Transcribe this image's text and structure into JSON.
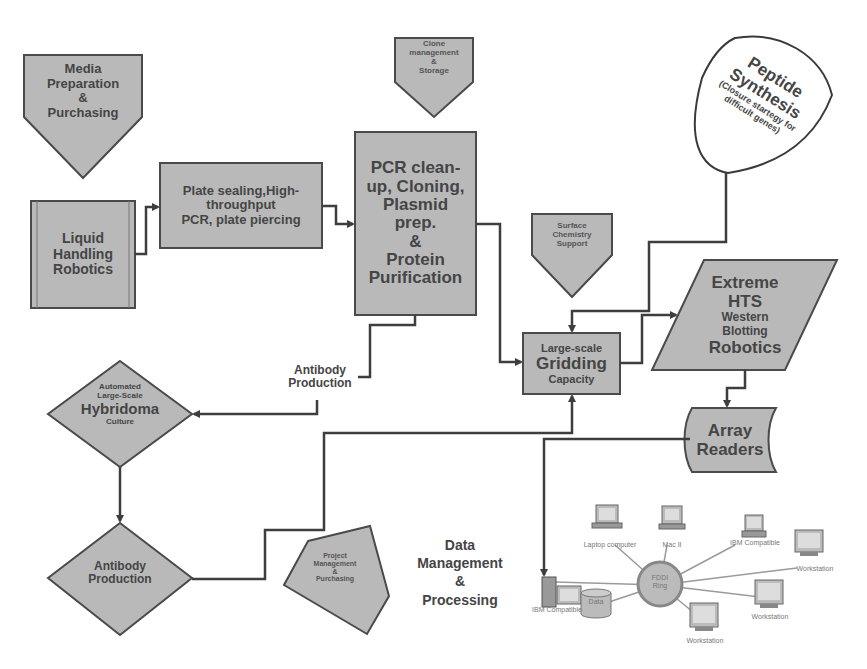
{
  "diagram": {
    "nodes": {
      "media_prep": {
        "lines": [
          "Media",
          "Preparation",
          "&",
          "Purchasing"
        ],
        "shape": "pentagon-down"
      },
      "liquid_handling": {
        "lines": [
          "Liquid",
          "Handling",
          "Robotics"
        ],
        "shape": "rectangle"
      },
      "plate_sealing": {
        "lines": [
          "Plate sealing,High-",
          "throughput",
          "PCR, plate piercing"
        ],
        "shape": "rectangle"
      },
      "clone_mgmt": {
        "lines": [
          "Clone",
          "management",
          "&",
          "Storage"
        ],
        "shape": "pentagon-down"
      },
      "pcr_cleanup": {
        "lines": [
          "PCR clean-",
          "up, Cloning,",
          "Plasmid",
          "prep.",
          "&",
          "Protein",
          "Purification"
        ],
        "shape": "rectangle"
      },
      "peptide": {
        "title_lines": [
          "Peptide",
          "Synthesis"
        ],
        "sub_lines": [
          "(Closure startegy for",
          "difficult genes)"
        ],
        "shape": "blob"
      },
      "surface_chem": {
        "lines": [
          "Surface",
          "Chemistry",
          "Support"
        ],
        "shape": "pentagon-down"
      },
      "extreme_hts": {
        "lines": [
          "Extreme",
          "HTS",
          "Western",
          "Blotting",
          "Robotics"
        ],
        "shape": "parallelogram"
      },
      "gridding": {
        "lines": [
          "Large-scale",
          "Gridding",
          "Capacity"
        ],
        "shape": "rectangle"
      },
      "array_readers": {
        "lines": [
          "Array",
          "Readers"
        ],
        "shape": "stored-data"
      },
      "hybridoma": {
        "lines": [
          "Automated",
          "Large-Scale",
          "Hybridoma",
          "Culture"
        ],
        "shape": "diamond"
      },
      "antibody_prod_diamond": {
        "lines": [
          "Antibody",
          "Production"
        ],
        "shape": "diamond"
      },
      "project_mgmt": {
        "lines": [
          "Project",
          "Management",
          "&",
          "Purchasing"
        ],
        "shape": "pentagon"
      },
      "data_mgmt": {
        "lines": [
          "Data",
          "Management",
          "&",
          "Processing"
        ],
        "shape": "text"
      }
    },
    "edge_labels": {
      "antibody_production": [
        "Antibody",
        "Production"
      ]
    },
    "network": {
      "hub": [
        "FDDI",
        "Ring"
      ],
      "devices": [
        {
          "label": "IBM Compatible",
          "type": "tower-pc"
        },
        {
          "label": "Laptop computer",
          "type": "laptop"
        },
        {
          "label": "Mac II",
          "type": "mac"
        },
        {
          "label": "IBM Compatible",
          "type": "pc"
        },
        {
          "label": "Workstation",
          "type": "workstation"
        },
        {
          "label": "Workstation",
          "type": "workstation"
        },
        {
          "label": "Workstation",
          "type": "workstation"
        },
        {
          "label": "Data",
          "type": "database"
        }
      ]
    },
    "colors": {
      "fill": "#b9b9b9",
      "stroke": "#4a4a4a",
      "text": "#454545",
      "background": "#ffffff"
    }
  }
}
